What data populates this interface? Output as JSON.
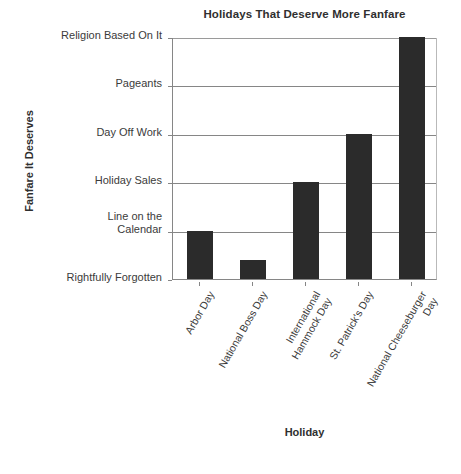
{
  "chart_data": {
    "type": "bar",
    "title": "Holidays That Deserve More Fanfare",
    "xlabel": "Holiday",
    "ylabel": "Fanfare It Deserves",
    "orientation": "vertical",
    "grid": true,
    "legend": false,
    "bar_color": "#2B2B2B",
    "categories": [
      "Arbor Day",
      "National Boss Day",
      "International\nHammock Day",
      "St. Patrick's Day",
      "National Cheeseburger Day"
    ],
    "values": [
      1,
      0.4,
      2,
      3,
      5
    ],
    "ytick_labels": [
      "Rightfully Forgotten",
      "Line on the\nCalendar",
      "Holiday Sales",
      "Day Off Work",
      "Pageants",
      "Religion Based On It"
    ],
    "ytick_values": [
      0,
      1,
      2,
      3,
      4,
      5
    ],
    "ylim": [
      0,
      5
    ],
    "y_scale": "ordinal",
    "value_labels": {
      "Arbor Day": "Line on the Calendar",
      "National Boss Day": "Rightfully Forgotten",
      "International Hammock Day": "Holiday Sales",
      "St. Patrick's Day": "Day Off Work",
      "National Cheeseburger Day": "Religion Based On It"
    }
  }
}
